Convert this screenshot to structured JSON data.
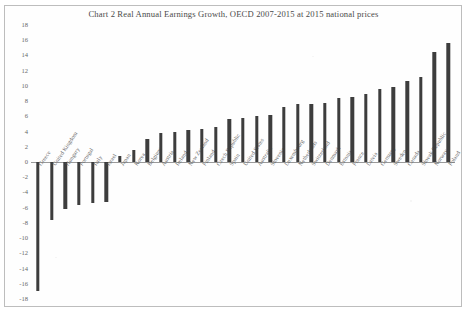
{
  "chart_data": {
    "type": "bar",
    "title": "Chart 2   Real Annual Earnings Growth, OECD 2007-2015 at 2015 national prices",
    "xlabel": "",
    "ylabel": "",
    "ylim": [
      -18,
      18
    ],
    "ytick_step": 2,
    "yticks": [
      "18",
      "16",
      "14",
      "12",
      "10",
      "8",
      "6",
      "4",
      "2",
      "0",
      "-2",
      "-4",
      "-6",
      "-8",
      "-10",
      "-12",
      "-14",
      "-16",
      "-18"
    ],
    "grid": false,
    "legend": "none",
    "categories": [
      "Greece",
      "United Kingdom",
      "Hungary",
      "Portugal",
      "Italy",
      "Israel",
      "Japan",
      "Korea",
      "Belgium",
      "Austria",
      "Ireland",
      "New Zealand",
      "Finland",
      "Czech Republic",
      "Spain",
      "United States",
      "Australia",
      "Slovenia",
      "Luxembourg",
      "Netherlands",
      "Switzerland",
      "Denmark",
      "Estonia",
      "France",
      "Latvia",
      "Germany",
      "Sweden",
      "Canada",
      "Slovak Republic",
      "Norway",
      "Poland"
    ],
    "values": [
      -17.0,
      -7.6,
      -6.2,
      -5.6,
      -5.4,
      -5.2,
      0.8,
      1.6,
      3.0,
      3.8,
      4.0,
      4.2,
      4.4,
      4.6,
      5.6,
      5.8,
      6.0,
      6.2,
      7.2,
      7.6,
      7.6,
      7.8,
      8.4,
      8.6,
      9.0,
      9.6,
      9.8,
      10.6,
      11.2,
      14.4,
      15.6
    ]
  },
  "figure": {
    "bar_color": "#3d3d3d",
    "axis_color": "#9a9a9a",
    "frame_color": "#bdbdbd",
    "background": "#ffffff"
  }
}
